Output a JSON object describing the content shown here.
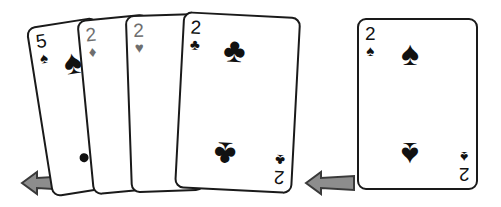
{
  "scene": {
    "title": "Playing cards illustration",
    "background_color": "#ffffff",
    "width": 501,
    "height": 207
  },
  "palette": {
    "ink": "#1a1a1a",
    "black_suit": "#111111",
    "red_suit_grayscale": "#6e6e6e",
    "arrow_fill": "#8d8d8d",
    "arrow_outline": "#3a3a3a",
    "card_face": "#ffffff"
  },
  "groups": [
    {
      "name": "fanned-hand",
      "description": "Four overlapping playing cards fanned out",
      "card_count": 4
    },
    {
      "name": "single-card",
      "description": "One playing card shown alone",
      "card_count": 1
    }
  ],
  "cards": {
    "fan": [
      {
        "id": "5-spades",
        "rank": "5",
        "suit_name": "spades",
        "suit_glyph": "♠",
        "color": "#111111",
        "is_red_suit": false,
        "corner_index": "5♠",
        "bottom_index": "5♠"
      },
      {
        "id": "2-diamonds",
        "rank": "2",
        "suit_name": "diamonds",
        "suit_glyph": "♦",
        "color": "#6e6e6e",
        "is_red_suit": true,
        "corner_index": "2♦",
        "bottom_index": "2♦"
      },
      {
        "id": "2-hearts",
        "rank": "2",
        "suit_name": "hearts",
        "suit_glyph": "♥",
        "color": "#6e6e6e",
        "is_red_suit": true,
        "corner_index": "2♥",
        "bottom_index": "2♥"
      },
      {
        "id": "2-clubs",
        "rank": "2",
        "suit_name": "clubs",
        "suit_glyph": "♣",
        "color": "#111111",
        "is_red_suit": false,
        "corner_index": "2♣",
        "bottom_index": "2♣"
      }
    ],
    "single": [
      {
        "id": "2-spades",
        "rank": "2",
        "suit_name": "spades",
        "suit_glyph": "♠",
        "color": "#111111",
        "is_red_suit": false,
        "corner_index": "2♠",
        "bottom_index": "2♠"
      }
    ]
  },
  "arrows": [
    {
      "id": "arrow-fan",
      "direction": "left",
      "label": "",
      "fill": "#8d8d8d",
      "outline": "#3a3a3a"
    },
    {
      "id": "arrow-single",
      "direction": "left",
      "label": "",
      "fill": "#8d8d8d",
      "outline": "#3a3a3a"
    }
  ]
}
